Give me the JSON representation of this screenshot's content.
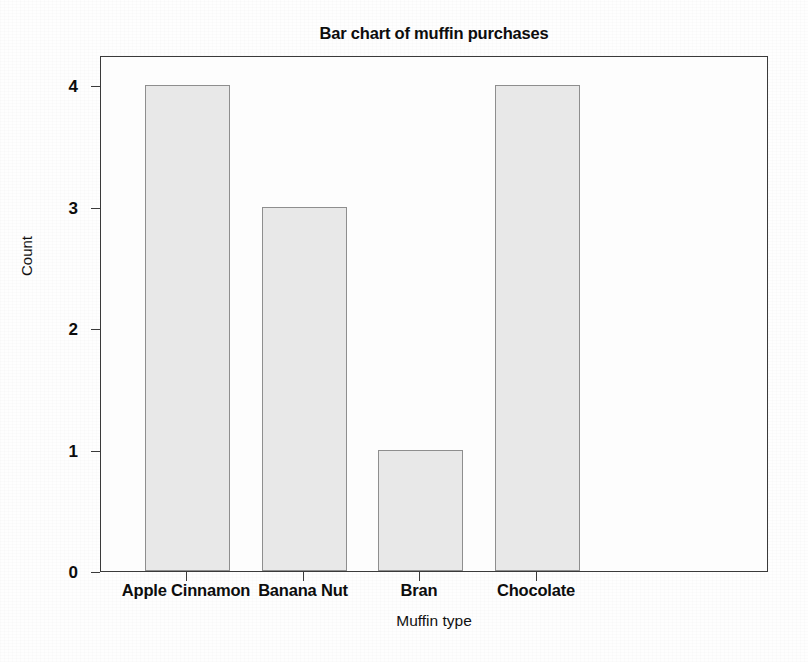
{
  "chart_data": {
    "type": "bar",
    "title": "Bar chart of muffin purchases",
    "xlabel": "Muffin type",
    "ylabel": "Count",
    "categories": [
      "Apple Cinnamon",
      "Banana Nut",
      "Bran",
      "Chocolate"
    ],
    "values": [
      4,
      3,
      1,
      4
    ],
    "ylim": [
      0,
      4
    ],
    "yticks": [
      0,
      1,
      2,
      3,
      4
    ],
    "ytick_labels": [
      "0",
      "1",
      "2",
      "3",
      "4"
    ],
    "grid": false,
    "legend": "none",
    "bar_fill_color": "#e8e8e8",
    "bar_border_color": "#8e8e8e",
    "axis_color": "#3a3a3a",
    "background_color": "#fdfdfd"
  }
}
